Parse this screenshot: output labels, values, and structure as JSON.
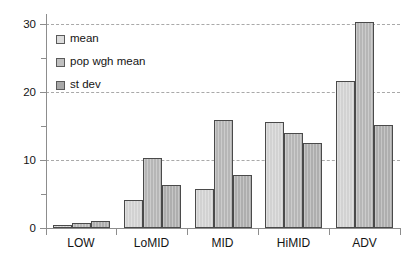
{
  "chart_data": {
    "type": "bar",
    "title": "",
    "xlabel": "",
    "ylabel": "",
    "categories": [
      "LOW",
      "LoMID",
      "MID",
      "HiMID",
      "ADV"
    ],
    "series": [
      {
        "name": "mean",
        "values": [
          0.4,
          4.1,
          5.7,
          15.6,
          21.7
        ]
      },
      {
        "name": "pop wgh mean",
        "values": [
          0.7,
          10.3,
          16.0,
          14.0,
          30.4
        ]
      },
      {
        "name": "st dev",
        "values": [
          1.0,
          6.4,
          7.8,
          12.5,
          15.2
        ]
      }
    ],
    "ylim": [
      0,
      31
    ],
    "yticks": [
      0,
      10,
      20,
      30
    ],
    "ytick_labels": [
      "0",
      "10",
      "20",
      "30"
    ],
    "yminor_ticks": [
      5,
      15,
      25
    ],
    "grid": "horizontal-dashed",
    "legend_position": "top-left",
    "colors": {
      "mean": "#d2d2d2",
      "pop wgh mean": "#b6b6b6",
      "st dev": "#aeaeae",
      "axis": "#8d8d8d",
      "gridline": "#a9a9a9",
      "bar_outline": "#4a4a4a",
      "text": "#141414",
      "background": "#ffffff"
    }
  },
  "legend": {
    "items": [
      {
        "label": "mean"
      },
      {
        "label": "pop wgh mean"
      },
      {
        "label": "st dev"
      }
    ]
  }
}
